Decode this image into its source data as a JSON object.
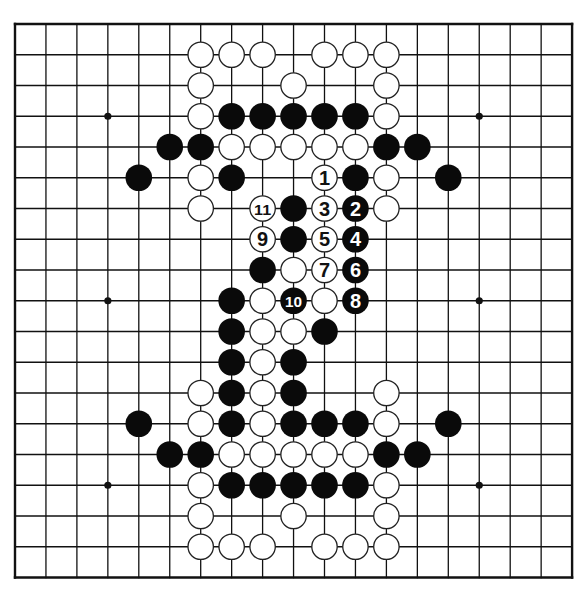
{
  "board": {
    "size": 19,
    "origin_x": 15,
    "origin_y": 24,
    "spacing_x": 30.95,
    "spacing_y": 30.75,
    "line_color": "#111111",
    "border_width": 2.4,
    "line_width": 1.3,
    "stone_radius": 13.3,
    "black_color": "#0a0a0a",
    "white_color": "#ffffff",
    "white_stroke": "#222222",
    "star_points": [
      [
        3,
        3
      ],
      [
        9,
        3
      ],
      [
        15,
        3
      ],
      [
        3,
        9
      ],
      [
        9,
        9
      ],
      [
        15,
        9
      ],
      [
        3,
        15
      ],
      [
        9,
        15
      ],
      [
        15,
        15
      ]
    ]
  },
  "stones": [
    {
      "c": 6,
      "r": 1,
      "color": "white"
    },
    {
      "c": 7,
      "r": 1,
      "color": "white"
    },
    {
      "c": 8,
      "r": 1,
      "color": "white"
    },
    {
      "c": 10,
      "r": 1,
      "color": "white"
    },
    {
      "c": 11,
      "r": 1,
      "color": "white"
    },
    {
      "c": 12,
      "r": 1,
      "color": "white"
    },
    {
      "c": 6,
      "r": 2,
      "color": "white"
    },
    {
      "c": 9,
      "r": 2,
      "color": "white"
    },
    {
      "c": 12,
      "r": 2,
      "color": "white"
    },
    {
      "c": 6,
      "r": 3,
      "color": "white"
    },
    {
      "c": 7,
      "r": 3,
      "color": "black"
    },
    {
      "c": 8,
      "r": 3,
      "color": "black"
    },
    {
      "c": 9,
      "r": 3,
      "color": "black"
    },
    {
      "c": 10,
      "r": 3,
      "color": "black"
    },
    {
      "c": 11,
      "r": 3,
      "color": "black"
    },
    {
      "c": 12,
      "r": 3,
      "color": "white"
    },
    {
      "c": 5,
      "r": 4,
      "color": "black"
    },
    {
      "c": 6,
      "r": 4,
      "color": "black"
    },
    {
      "c": 7,
      "r": 4,
      "color": "white"
    },
    {
      "c": 8,
      "r": 4,
      "color": "white"
    },
    {
      "c": 9,
      "r": 4,
      "color": "white"
    },
    {
      "c": 10,
      "r": 4,
      "color": "white"
    },
    {
      "c": 11,
      "r": 4,
      "color": "white"
    },
    {
      "c": 12,
      "r": 4,
      "color": "black"
    },
    {
      "c": 13,
      "r": 4,
      "color": "black"
    },
    {
      "c": 4,
      "r": 5,
      "color": "black"
    },
    {
      "c": 6,
      "r": 5,
      "color": "white"
    },
    {
      "c": 7,
      "r": 5,
      "color": "black"
    },
    {
      "c": 10,
      "r": 5,
      "color": "white",
      "label": "1"
    },
    {
      "c": 11,
      "r": 5,
      "color": "black"
    },
    {
      "c": 12,
      "r": 5,
      "color": "white"
    },
    {
      "c": 14,
      "r": 5,
      "color": "black"
    },
    {
      "c": 6,
      "r": 6,
      "color": "white"
    },
    {
      "c": 8,
      "r": 6,
      "color": "white",
      "label": "11"
    },
    {
      "c": 9,
      "r": 6,
      "color": "black"
    },
    {
      "c": 10,
      "r": 6,
      "color": "white",
      "label": "3"
    },
    {
      "c": 11,
      "r": 6,
      "color": "black",
      "label": "2"
    },
    {
      "c": 12,
      "r": 6,
      "color": "white"
    },
    {
      "c": 8,
      "r": 7,
      "color": "white",
      "label": "9"
    },
    {
      "c": 9,
      "r": 7,
      "color": "black"
    },
    {
      "c": 10,
      "r": 7,
      "color": "white",
      "label": "5"
    },
    {
      "c": 11,
      "r": 7,
      "color": "black",
      "label": "4"
    },
    {
      "c": 8,
      "r": 8,
      "color": "black"
    },
    {
      "c": 9,
      "r": 8,
      "color": "white"
    },
    {
      "c": 10,
      "r": 8,
      "color": "white",
      "label": "7"
    },
    {
      "c": 11,
      "r": 8,
      "color": "black",
      "label": "6"
    },
    {
      "c": 7,
      "r": 9,
      "color": "black"
    },
    {
      "c": 8,
      "r": 9,
      "color": "white"
    },
    {
      "c": 9,
      "r": 9,
      "color": "black",
      "label": "10"
    },
    {
      "c": 10,
      "r": 9,
      "color": "white"
    },
    {
      "c": 11,
      "r": 9,
      "color": "black",
      "label": "8"
    },
    {
      "c": 7,
      "r": 10,
      "color": "black"
    },
    {
      "c": 8,
      "r": 10,
      "color": "white"
    },
    {
      "c": 9,
      "r": 10,
      "color": "white"
    },
    {
      "c": 10,
      "r": 10,
      "color": "black"
    },
    {
      "c": 7,
      "r": 11,
      "color": "black"
    },
    {
      "c": 8,
      "r": 11,
      "color": "white"
    },
    {
      "c": 9,
      "r": 11,
      "color": "black"
    },
    {
      "c": 6,
      "r": 12,
      "color": "white"
    },
    {
      "c": 7,
      "r": 12,
      "color": "black"
    },
    {
      "c": 8,
      "r": 12,
      "color": "white"
    },
    {
      "c": 9,
      "r": 12,
      "color": "black"
    },
    {
      "c": 12,
      "r": 12,
      "color": "white"
    },
    {
      "c": 4,
      "r": 13,
      "color": "black"
    },
    {
      "c": 6,
      "r": 13,
      "color": "white"
    },
    {
      "c": 7,
      "r": 13,
      "color": "black"
    },
    {
      "c": 8,
      "r": 13,
      "color": "white"
    },
    {
      "c": 9,
      "r": 13,
      "color": "black"
    },
    {
      "c": 10,
      "r": 13,
      "color": "black"
    },
    {
      "c": 11,
      "r": 13,
      "color": "black"
    },
    {
      "c": 12,
      "r": 13,
      "color": "white"
    },
    {
      "c": 14,
      "r": 13,
      "color": "black"
    },
    {
      "c": 5,
      "r": 14,
      "color": "black"
    },
    {
      "c": 6,
      "r": 14,
      "color": "black"
    },
    {
      "c": 7,
      "r": 14,
      "color": "white"
    },
    {
      "c": 8,
      "r": 14,
      "color": "white"
    },
    {
      "c": 9,
      "r": 14,
      "color": "white"
    },
    {
      "c": 10,
      "r": 14,
      "color": "white"
    },
    {
      "c": 11,
      "r": 14,
      "color": "white"
    },
    {
      "c": 12,
      "r": 14,
      "color": "black"
    },
    {
      "c": 13,
      "r": 14,
      "color": "black"
    },
    {
      "c": 6,
      "r": 15,
      "color": "white"
    },
    {
      "c": 7,
      "r": 15,
      "color": "black"
    },
    {
      "c": 8,
      "r": 15,
      "color": "black"
    },
    {
      "c": 9,
      "r": 15,
      "color": "black"
    },
    {
      "c": 10,
      "r": 15,
      "color": "black"
    },
    {
      "c": 11,
      "r": 15,
      "color": "black"
    },
    {
      "c": 12,
      "r": 15,
      "color": "white"
    },
    {
      "c": 6,
      "r": 16,
      "color": "white"
    },
    {
      "c": 9,
      "r": 16,
      "color": "white"
    },
    {
      "c": 12,
      "r": 16,
      "color": "white"
    },
    {
      "c": 6,
      "r": 17,
      "color": "white"
    },
    {
      "c": 7,
      "r": 17,
      "color": "white"
    },
    {
      "c": 8,
      "r": 17,
      "color": "white"
    },
    {
      "c": 10,
      "r": 17,
      "color": "white"
    },
    {
      "c": 11,
      "r": 17,
      "color": "white"
    },
    {
      "c": 12,
      "r": 17,
      "color": "white"
    }
  ]
}
